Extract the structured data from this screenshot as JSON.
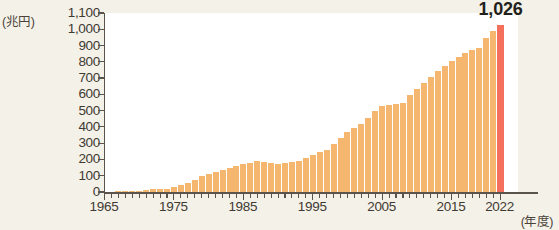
{
  "chart_data": {
    "type": "bar",
    "title": "",
    "xlabel": "(年度)",
    "ylabel": "(兆円)",
    "ylim": [
      0,
      1100
    ],
    "xlim": [
      1965,
      2022
    ],
    "grid": false,
    "legend": null,
    "y_ticks": [
      "1,100",
      "1,000",
      "900",
      "800",
      "700",
      "600",
      "500",
      "400",
      "300",
      "200",
      "100",
      "0"
    ],
    "y_tick_values": [
      1100,
      1000,
      900,
      800,
      700,
      600,
      500,
      400,
      300,
      200,
      100,
      0
    ],
    "x_ticks": [
      "1965",
      "1975",
      "1985",
      "1995",
      "2005",
      "2015",
      "2022"
    ],
    "x_tick_values": [
      1965,
      1975,
      1985,
      1995,
      2005,
      2015,
      2022
    ],
    "bar_color": "#f5b76f",
    "highlight_color": "#f4705c",
    "highlight_category": 2022,
    "annotations": [
      {
        "text": "1,026",
        "x": 2022,
        "y": 1026
      }
    ],
    "categories": [
      1965,
      1966,
      1967,
      1968,
      1969,
      1970,
      1971,
      1972,
      1973,
      1974,
      1975,
      1976,
      1977,
      1978,
      1979,
      1980,
      1981,
      1982,
      1983,
      1984,
      1985,
      1986,
      1987,
      1988,
      1989,
      1990,
      1991,
      1992,
      1993,
      1994,
      1995,
      1996,
      1997,
      1998,
      1999,
      2000,
      2001,
      2002,
      2003,
      2004,
      2005,
      2006,
      2007,
      2008,
      2009,
      2010,
      2011,
      2012,
      2013,
      2014,
      2015,
      2016,
      2017,
      2018,
      2019,
      2020,
      2021,
      2022
    ],
    "values": [
      2,
      3,
      4,
      5,
      6,
      8,
      12,
      16,
      18,
      21,
      31,
      43,
      57,
      76,
      96,
      110,
      122,
      134,
      147,
      159,
      170,
      180,
      189,
      183,
      176,
      172,
      178,
      184,
      193,
      207,
      229,
      248,
      259,
      295,
      332,
      368,
      392,
      421,
      457,
      499,
      527,
      532,
      541,
      546,
      594,
      636,
      670,
      705,
      744,
      774,
      805,
      831,
      853,
      874,
      887,
      947,
      991,
      1026
    ]
  }
}
